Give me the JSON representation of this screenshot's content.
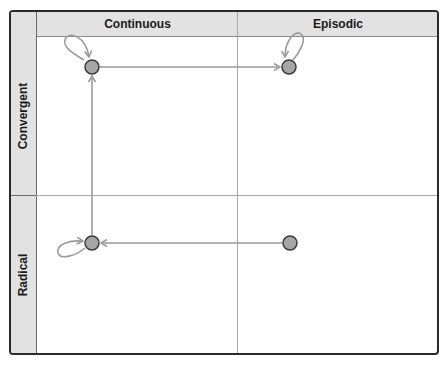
{
  "diagram": {
    "columns": [
      {
        "label": "Continuous"
      },
      {
        "label": "Episodic"
      }
    ],
    "rows": [
      {
        "label": "Convergent"
      },
      {
        "label": "Radical"
      }
    ],
    "nodes": [
      {
        "id": "convergent-continuous",
        "row": "Convergent",
        "column": "Continuous",
        "self_loop": true
      },
      {
        "id": "convergent-episodic",
        "row": "Convergent",
        "column": "Episodic",
        "self_loop": true
      },
      {
        "id": "radical-continuous",
        "row": "Radical",
        "column": "Continuous",
        "self_loop": true
      },
      {
        "id": "radical-episodic",
        "row": "Radical",
        "column": "Episodic",
        "self_loop": false
      }
    ],
    "edges": [
      {
        "from": "radical-episodic",
        "to": "radical-continuous"
      },
      {
        "from": "radical-continuous",
        "to": "convergent-continuous"
      },
      {
        "from": "convergent-continuous",
        "to": "convergent-episodic"
      }
    ],
    "colors": {
      "header_fill": "#e2e2e2",
      "node_fill": "#a6a6a6",
      "node_stroke": "#3a3a3a",
      "arrow": "#9a9a9a",
      "border": "#2a2a2a",
      "grid": "#a8a8a8"
    }
  }
}
